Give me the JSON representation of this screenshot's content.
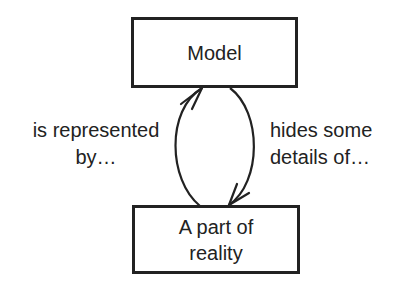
{
  "diagram": {
    "nodes": [
      {
        "id": "model",
        "label": "Model"
      },
      {
        "id": "reality",
        "label_lines": [
          "A part of",
          "reality"
        ]
      }
    ],
    "edges": [
      {
        "from": "reality",
        "to": "model",
        "label_lines": [
          "is represented",
          "by…"
        ],
        "side": "left"
      },
      {
        "from": "model",
        "to": "reality",
        "label_lines": [
          "hides some",
          "details of…"
        ],
        "side": "right"
      }
    ],
    "colors": {
      "stroke": "#222222",
      "background": "#ffffff"
    }
  }
}
